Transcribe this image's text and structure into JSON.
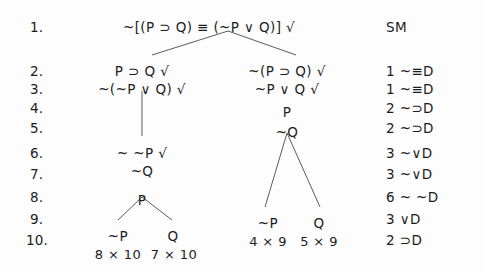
{
  "document": {
    "type": "truth-tree-derivation",
    "justification_header": "SM"
  },
  "line_numbers": [
    "1.",
    "2.",
    "3.",
    "4.",
    "5.",
    "6.",
    "7.",
    "8.",
    "9.",
    "10."
  ],
  "formulas": [
    {
      "id": "f1",
      "text": "~[(P ⊃ Q) ≡ (~P ∨ Q)] √",
      "line": 1,
      "x": 209,
      "y": 19
    },
    {
      "id": "f2",
      "text": "P ⊃ Q √",
      "line": 2,
      "x": 142,
      "y": 63
    },
    {
      "id": "f3",
      "text": "~(~P ∨ Q) √",
      "line": 3,
      "x": 142,
      "y": 81
    },
    {
      "id": "f6",
      "text": "~ ~P √",
      "line": 6,
      "x": 142,
      "y": 145
    },
    {
      "id": "f7",
      "text": "~Q",
      "line": 7,
      "x": 142,
      "y": 163
    },
    {
      "id": "f8",
      "text": "P",
      "line": 8,
      "x": 142,
      "y": 192
    },
    {
      "id": "f10a",
      "text": "~P",
      "line": 10,
      "x": 118,
      "y": 228
    },
    {
      "id": "f10b",
      "text": "Q",
      "line": 10,
      "x": 173,
      "y": 228
    },
    {
      "id": "f2r",
      "text": "~(P ⊃ Q) √",
      "line": 2,
      "x": 287,
      "y": 63
    },
    {
      "id": "f3r",
      "text": "~P ∨ Q √",
      "line": 3,
      "x": 287,
      "y": 81
    },
    {
      "id": "f4r",
      "text": "P",
      "line": 4,
      "x": 287,
      "y": 104
    },
    {
      "id": "f5r",
      "text": "~Q",
      "line": 5,
      "x": 287,
      "y": 124
    },
    {
      "id": "f10c",
      "text": "~P",
      "line": 10,
      "x": 268,
      "y": 215
    },
    {
      "id": "f10d",
      "text": "Q",
      "line": 10,
      "x": 319,
      "y": 215
    }
  ],
  "closures": [
    {
      "id": "c1",
      "text": "8 × 10",
      "x": 118,
      "y": 247
    },
    {
      "id": "c2",
      "text": "7 × 10",
      "x": 174,
      "y": 247
    },
    {
      "id": "c3",
      "text": "4 × 9",
      "x": 268,
      "y": 234
    },
    {
      "id": "c4",
      "text": "5 × 9",
      "x": 319,
      "y": 234
    }
  ],
  "justifications": [
    {
      "line": 1,
      "text": "SM",
      "y": 19
    },
    {
      "line": 2,
      "text": "1 ~≡D",
      "y": 63
    },
    {
      "line": 3,
      "text": "1 ~≡D",
      "y": 81
    },
    {
      "line": 4,
      "text": "2 ~⊃D",
      "y": 100
    },
    {
      "line": 5,
      "text": "2 ~⊃D",
      "y": 120
    },
    {
      "line": 6,
      "text": "3 ~∨D",
      "y": 145
    },
    {
      "line": 7,
      "text": "3 ~∨D",
      "y": 166
    },
    {
      "line": 8,
      "text": "6 ~ ~D",
      "y": 189
    },
    {
      "line": 9,
      "text": "3 ∨D",
      "y": 211
    },
    {
      "line": 10,
      "text": "2 ⊃D",
      "y": 232
    }
  ],
  "line_number_positions": [
    {
      "label": "1.",
      "x": 30,
      "y": 19
    },
    {
      "label": "2.",
      "x": 30,
      "y": 63
    },
    {
      "label": "3.",
      "x": 30,
      "y": 81
    },
    {
      "label": "4.",
      "x": 30,
      "y": 100
    },
    {
      "label": "5.",
      "x": 30,
      "y": 120
    },
    {
      "label": "6.",
      "x": 30,
      "y": 145
    },
    {
      "label": "7.",
      "x": 30,
      "y": 166
    },
    {
      "label": "8.",
      "x": 30,
      "y": 189
    },
    {
      "label": "9.",
      "x": 30,
      "y": 211
    },
    {
      "label": "10.",
      "x": 26,
      "y": 232
    }
  ],
  "justification_x": 386,
  "branch_lines": [
    {
      "name": "root-left",
      "x1": 228,
      "y1": 31,
      "x2": 152,
      "y2": 55
    },
    {
      "name": "root-right",
      "x1": 228,
      "y1": 31,
      "x2": 296,
      "y2": 55
    },
    {
      "name": "left-stem",
      "x1": 142,
      "y1": 91,
      "x2": 142,
      "y2": 136
    },
    {
      "name": "left-fork-left",
      "x1": 142,
      "y1": 197,
      "x2": 118,
      "y2": 220
    },
    {
      "name": "left-fork-right",
      "x1": 142,
      "y1": 197,
      "x2": 172,
      "y2": 220
    },
    {
      "name": "right-fork-left",
      "x1": 287,
      "y1": 133,
      "x2": 265,
      "y2": 207
    },
    {
      "name": "right-fork-right",
      "x1": 287,
      "y1": 133,
      "x2": 320,
      "y2": 207
    }
  ],
  "colors": {
    "background": "#fdfdfd",
    "text": "#1c1c1c",
    "branch_stroke": "#5a5a60"
  }
}
